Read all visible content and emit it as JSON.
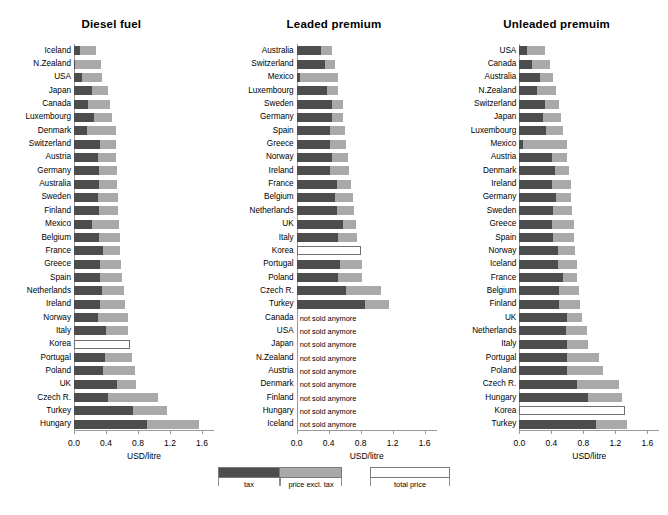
{
  "figure": {
    "xlabel": "USD/litre",
    "tick_labels": [
      "0.0",
      "0.4",
      "0.8",
      "1.2",
      "1.6"
    ],
    "tick_values": [
      0.0,
      0.4,
      0.8,
      1.2,
      1.6
    ],
    "not_sold_text": "not sold anymore",
    "colors": {
      "tax": "#4d4d4d",
      "price_excl_tax": "#a9a9a9",
      "total_price": "#ffffff",
      "outline": "#6f6f6f",
      "axis": "#9a9a9a"
    }
  },
  "legend": {
    "items": [
      {
        "name": "tax",
        "label": "tax",
        "color": "#4d4d4d"
      },
      {
        "name": "price-excl-tax",
        "label": "price excl. tax",
        "color": "#a9a9a9"
      },
      {
        "name": "total-price",
        "label": "total price",
        "color": "#ffffff"
      }
    ]
  },
  "chart_data": [
    {
      "type": "bar",
      "title": "Diesel fuel",
      "orientation": "horizontal",
      "xlabel": "USD/litre",
      "ylabel": "",
      "xlim": [
        0.0,
        1.75
      ],
      "grid": false,
      "legend_position": "bottom-center",
      "stacked": true,
      "series": [
        {
          "name": "tax",
          "color": "#4d4d4d"
        },
        {
          "name": "price excl. tax",
          "color": "#a9a9a9"
        }
      ],
      "categories": [
        "Iceland",
        "N.Zealand",
        "USA",
        "Japan",
        "Canada",
        "Luxembourg",
        "Denmark",
        "Switzerland",
        "Austria",
        "Germany",
        "Australia",
        "Sweden",
        "Finland",
        "Mexico",
        "Belgium",
        "France",
        "Greece",
        "Spain",
        "Netherlands",
        "Ireland",
        "Norway",
        "Italy",
        "Korea",
        "Portugal",
        "Poland",
        "UK",
        "Czech R.",
        "Turkey",
        "Hungary"
      ],
      "rows": [
        {
          "category": "Iceland",
          "tax": 0.08,
          "net": 0.2,
          "total": 0.28,
          "total_only": false
        },
        {
          "category": "N.Zealand",
          "tax": 0.01,
          "net": 0.33,
          "total": 0.34,
          "total_only": false
        },
        {
          "category": "USA",
          "tax": 0.1,
          "net": 0.25,
          "total": 0.35,
          "total_only": false
        },
        {
          "category": "Japan",
          "tax": 0.22,
          "net": 0.2,
          "total": 0.42,
          "total_only": false
        },
        {
          "category": "Canada",
          "tax": 0.17,
          "net": 0.28,
          "total": 0.45,
          "total_only": false
        },
        {
          "category": "Luxembourg",
          "tax": 0.25,
          "net": 0.22,
          "total": 0.47,
          "total_only": false
        },
        {
          "category": "Denmark",
          "tax": 0.16,
          "net": 0.36,
          "total": 0.52,
          "total_only": false
        },
        {
          "category": "Switzerland",
          "tax": 0.33,
          "net": 0.2,
          "total": 0.53,
          "total_only": false
        },
        {
          "category": "Austria",
          "tax": 0.3,
          "net": 0.23,
          "total": 0.53,
          "total_only": false
        },
        {
          "category": "Germany",
          "tax": 0.31,
          "net": 0.23,
          "total": 0.54,
          "total_only": false
        },
        {
          "category": "Australia",
          "tax": 0.31,
          "net": 0.23,
          "total": 0.54,
          "total_only": false
        },
        {
          "category": "Sweden",
          "tax": 0.3,
          "net": 0.25,
          "total": 0.55,
          "total_only": false
        },
        {
          "category": "Finland",
          "tax": 0.31,
          "net": 0.24,
          "total": 0.55,
          "total_only": false
        },
        {
          "category": "Mexico",
          "tax": 0.22,
          "net": 0.34,
          "total": 0.56,
          "total_only": false
        },
        {
          "category": "Belgium",
          "tax": 0.31,
          "net": 0.26,
          "total": 0.57,
          "total_only": false
        },
        {
          "category": "France",
          "tax": 0.36,
          "net": 0.22,
          "total": 0.58,
          "total_only": false
        },
        {
          "category": "Greece",
          "tax": 0.33,
          "net": 0.26,
          "total": 0.59,
          "total_only": false
        },
        {
          "category": "Spain",
          "tax": 0.33,
          "net": 0.27,
          "total": 0.6,
          "total_only": false
        },
        {
          "category": "Netherlands",
          "tax": 0.35,
          "net": 0.27,
          "total": 0.62,
          "total_only": false
        },
        {
          "category": "Ireland",
          "tax": 0.33,
          "net": 0.31,
          "total": 0.64,
          "total_only": false
        },
        {
          "category": "Norway",
          "tax": 0.3,
          "net": 0.37,
          "total": 0.67,
          "total_only": false
        },
        {
          "category": "Italy",
          "tax": 0.4,
          "net": 0.28,
          "total": 0.68,
          "total_only": false
        },
        {
          "category": "Korea",
          "tax": null,
          "net": null,
          "total": 0.7,
          "total_only": true
        },
        {
          "category": "Portugal",
          "tax": 0.39,
          "net": 0.33,
          "total": 0.72,
          "total_only": false
        },
        {
          "category": "Poland",
          "tax": 0.36,
          "net": 0.4,
          "total": 0.76,
          "total_only": false
        },
        {
          "category": "UK",
          "tax": 0.54,
          "net": 0.24,
          "total": 0.78,
          "total_only": false
        },
        {
          "category": "Czech R.",
          "tax": 0.42,
          "net": 0.63,
          "total": 1.05,
          "total_only": false
        },
        {
          "category": "Turkey",
          "tax": 0.74,
          "net": 0.42,
          "total": 1.16,
          "total_only": false
        },
        {
          "category": "Hungary",
          "tax": 0.91,
          "net": 0.65,
          "total": 1.56,
          "total_only": false
        }
      ]
    },
    {
      "type": "bar",
      "title": "Leaded premium",
      "orientation": "horizontal",
      "xlabel": "USD/litre",
      "ylabel": "",
      "xlim": [
        0.0,
        1.75
      ],
      "grid": false,
      "legend_position": "bottom-center",
      "stacked": true,
      "series": [
        {
          "name": "tax",
          "color": "#4d4d4d"
        },
        {
          "name": "price excl. tax",
          "color": "#a9a9a9"
        }
      ],
      "categories": [
        "Australia",
        "Switzerland",
        "Mexico",
        "Luxembourg",
        "Sweden",
        "Germany",
        "Spain",
        "Greece",
        "Norway",
        "Ireland",
        "France",
        "Belgium",
        "Netherlands",
        "UK",
        "Italy",
        "Korea",
        "Portugal",
        "Poland",
        "Czech R.",
        "Turkey",
        "Canada",
        "USA",
        "Japan",
        "N.Zealand",
        "Austria",
        "Denmark",
        "Finland",
        "Hungary",
        "Iceland"
      ],
      "rows": [
        {
          "category": "Australia",
          "tax": 0.3,
          "net": 0.14,
          "total": 0.44,
          "total_only": false
        },
        {
          "category": "Switzerland",
          "tax": 0.36,
          "net": 0.12,
          "total": 0.48,
          "total_only": false
        },
        {
          "category": "Mexico",
          "tax": 0.04,
          "net": 0.48,
          "total": 0.52,
          "total_only": false
        },
        {
          "category": "Luxembourg",
          "tax": 0.38,
          "net": 0.14,
          "total": 0.52,
          "total_only": false
        },
        {
          "category": "Sweden",
          "tax": 0.44,
          "net": 0.14,
          "total": 0.58,
          "total_only": false
        },
        {
          "category": "Germany",
          "tax": 0.44,
          "net": 0.14,
          "total": 0.58,
          "total_only": false
        },
        {
          "category": "Spain",
          "tax": 0.42,
          "net": 0.18,
          "total": 0.6,
          "total_only": false
        },
        {
          "category": "Greece",
          "tax": 0.42,
          "net": 0.2,
          "total": 0.62,
          "total_only": false
        },
        {
          "category": "Norway",
          "tax": 0.44,
          "net": 0.2,
          "total": 0.64,
          "total_only": false
        },
        {
          "category": "Ireland",
          "tax": 0.42,
          "net": 0.24,
          "total": 0.66,
          "total_only": false
        },
        {
          "category": "France",
          "tax": 0.5,
          "net": 0.18,
          "total": 0.68,
          "total_only": false
        },
        {
          "category": "Belgium",
          "tax": 0.48,
          "net": 0.22,
          "total": 0.7,
          "total_only": false
        },
        {
          "category": "Netherlands",
          "tax": 0.5,
          "net": 0.22,
          "total": 0.72,
          "total_only": false
        },
        {
          "category": "UK",
          "tax": 0.58,
          "net": 0.16,
          "total": 0.74,
          "total_only": false
        },
        {
          "category": "Italy",
          "tax": 0.52,
          "net": 0.24,
          "total": 0.76,
          "total_only": false
        },
        {
          "category": "Korea",
          "tax": null,
          "net": null,
          "total": 0.8,
          "total_only": true
        },
        {
          "category": "Portugal",
          "tax": 0.54,
          "net": 0.28,
          "total": 0.82,
          "total_only": false
        },
        {
          "category": "Poland",
          "tax": 0.52,
          "net": 0.3,
          "total": 0.82,
          "total_only": false
        },
        {
          "category": "Czech R.",
          "tax": 0.62,
          "net": 0.44,
          "total": 1.06,
          "total_only": false
        },
        {
          "category": "Turkey",
          "tax": 0.86,
          "net": 0.3,
          "total": 1.16,
          "total_only": false
        },
        {
          "category": "Canada",
          "tax": null,
          "net": null,
          "total": null,
          "total_only": false,
          "not_sold": true
        },
        {
          "category": "USA",
          "tax": null,
          "net": null,
          "total": null,
          "total_only": false,
          "not_sold": true
        },
        {
          "category": "Japan",
          "tax": null,
          "net": null,
          "total": null,
          "total_only": false,
          "not_sold": true
        },
        {
          "category": "N.Zealand",
          "tax": null,
          "net": null,
          "total": null,
          "total_only": false,
          "not_sold": true
        },
        {
          "category": "Austria",
          "tax": null,
          "net": null,
          "total": null,
          "total_only": false,
          "not_sold": true
        },
        {
          "category": "Denmark",
          "tax": null,
          "net": null,
          "total": null,
          "total_only": false,
          "not_sold": true
        },
        {
          "category": "Finland",
          "tax": null,
          "net": null,
          "total": null,
          "total_only": false,
          "not_sold": true
        },
        {
          "category": "Hungary",
          "tax": null,
          "net": null,
          "total": null,
          "total_only": false,
          "not_sold": true
        },
        {
          "category": "Iceland",
          "tax": null,
          "net": null,
          "total": null,
          "total_only": false,
          "not_sold": true
        }
      ]
    },
    {
      "type": "bar",
      "title": "Unleaded premuim",
      "orientation": "horizontal",
      "xlabel": "USD/litre",
      "ylabel": "",
      "xlim": [
        0.0,
        1.75
      ],
      "grid": false,
      "legend_position": "bottom-center",
      "stacked": true,
      "series": [
        {
          "name": "tax",
          "color": "#4d4d4d"
        },
        {
          "name": "price excl. tax",
          "color": "#a9a9a9"
        }
      ],
      "categories": [
        "USA",
        "Canada",
        "Australia",
        "N.Zealand",
        "Switzerland",
        "Japan",
        "Luxembourg",
        "Mexico",
        "Austria",
        "Denmark",
        "Ireland",
        "Germany",
        "Sweden",
        "Greece",
        "Spain",
        "Norway",
        "Iceland",
        "France",
        "Belgium",
        "Finland",
        "UK",
        "Netherlands",
        "Italy",
        "Portugal",
        "Poland",
        "Czech R.",
        "Hungary",
        "Korea",
        "Turkey"
      ],
      "rows": [
        {
          "category": "USA",
          "tax": 0.1,
          "net": 0.22,
          "total": 0.32,
          "total_only": false
        },
        {
          "category": "Canada",
          "tax": 0.16,
          "net": 0.22,
          "total": 0.38,
          "total_only": false
        },
        {
          "category": "Australia",
          "tax": 0.26,
          "net": 0.16,
          "total": 0.42,
          "total_only": false
        },
        {
          "category": "N.Zealand",
          "tax": 0.22,
          "net": 0.24,
          "total": 0.46,
          "total_only": false
        },
        {
          "category": "Switzerland",
          "tax": 0.32,
          "net": 0.18,
          "total": 0.5,
          "total_only": false
        },
        {
          "category": "Japan",
          "tax": 0.3,
          "net": 0.22,
          "total": 0.52,
          "total_only": false
        },
        {
          "category": "Luxembourg",
          "tax": 0.33,
          "net": 0.22,
          "total": 0.55,
          "total_only": false
        },
        {
          "category": "Mexico",
          "tax": 0.04,
          "net": 0.56,
          "total": 0.6,
          "total_only": false
        },
        {
          "category": "Austria",
          "tax": 0.41,
          "net": 0.19,
          "total": 0.6,
          "total_only": false
        },
        {
          "category": "Denmark",
          "tax": 0.44,
          "net": 0.18,
          "total": 0.62,
          "total_only": false
        },
        {
          "category": "Ireland",
          "tax": 0.41,
          "net": 0.23,
          "total": 0.64,
          "total_only": false
        },
        {
          "category": "Germany",
          "tax": 0.46,
          "net": 0.18,
          "total": 0.64,
          "total_only": false
        },
        {
          "category": "Sweden",
          "tax": 0.42,
          "net": 0.24,
          "total": 0.66,
          "total_only": false
        },
        {
          "category": "Greece",
          "tax": 0.41,
          "net": 0.27,
          "total": 0.68,
          "total_only": false
        },
        {
          "category": "Spain",
          "tax": 0.42,
          "net": 0.26,
          "total": 0.68,
          "total_only": false
        },
        {
          "category": "Norway",
          "tax": 0.48,
          "net": 0.22,
          "total": 0.7,
          "total_only": false
        },
        {
          "category": "Iceland",
          "tax": 0.48,
          "net": 0.24,
          "total": 0.72,
          "total_only": false
        },
        {
          "category": "France",
          "tax": 0.54,
          "net": 0.18,
          "total": 0.72,
          "total_only": false
        },
        {
          "category": "Belgium",
          "tax": 0.5,
          "net": 0.24,
          "total": 0.74,
          "total_only": false
        },
        {
          "category": "Finland",
          "tax": 0.5,
          "net": 0.26,
          "total": 0.76,
          "total_only": false
        },
        {
          "category": "UK",
          "tax": 0.6,
          "net": 0.18,
          "total": 0.78,
          "total_only": false
        },
        {
          "category": "Netherlands",
          "tax": 0.58,
          "net": 0.26,
          "total": 0.84,
          "total_only": false
        },
        {
          "category": "Italy",
          "tax": 0.59,
          "net": 0.27,
          "total": 0.86,
          "total_only": false
        },
        {
          "category": "Portugal",
          "tax": 0.6,
          "net": 0.4,
          "total": 1.0,
          "total_only": false
        },
        {
          "category": "Poland",
          "tax": 0.6,
          "net": 0.44,
          "total": 1.04,
          "total_only": false
        },
        {
          "category": "Czech R.",
          "tax": 0.72,
          "net": 0.52,
          "total": 1.24,
          "total_only": false
        },
        {
          "category": "Hungary",
          "tax": 0.86,
          "net": 0.42,
          "total": 1.28,
          "total_only": false
        },
        {
          "category": "Korea",
          "tax": null,
          "net": null,
          "total": 1.32,
          "total_only": true
        },
        {
          "category": "Turkey",
          "tax": 0.96,
          "net": 0.38,
          "total": 1.34,
          "total_only": false
        }
      ]
    }
  ]
}
